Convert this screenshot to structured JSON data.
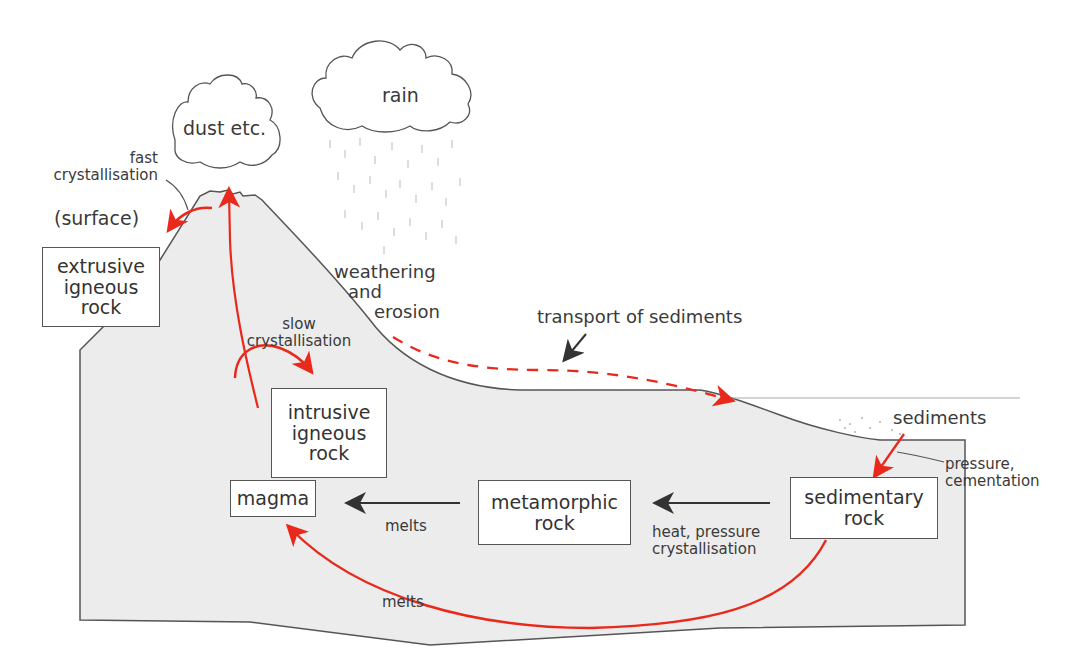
{
  "colors": {
    "ground_fill": "#ececec",
    "outline": "#555555",
    "process_arrow_red": "#e8291c",
    "process_arrow_dark": "#333333",
    "text": "#3a3a3a"
  },
  "clouds": {
    "dust": "dust etc.",
    "rain": "rain"
  },
  "rock_boxes": {
    "extrusive": [
      "extrusive",
      "igneous",
      "rock"
    ],
    "intrusive": [
      "intrusive",
      "igneous",
      "rock"
    ],
    "magma": "magma",
    "metamorphic": [
      "metamorphic",
      "rock"
    ],
    "sedimentary": [
      "sedimentary",
      "rock"
    ]
  },
  "process_labels": {
    "fast_crystallisation": [
      "fast",
      "crystallisation"
    ],
    "surface": "(surface)",
    "weathering": [
      "weathering",
      "and",
      "erosion"
    ],
    "transport": "transport of sediments",
    "slow_crystallisation": [
      "slow",
      "crystallisation"
    ],
    "sediments": "sediments",
    "pressure_cementation": [
      "pressure,",
      "cementation"
    ],
    "melts_upper": "melts",
    "heat_pressure": [
      "heat, pressure",
      "crystallisation"
    ],
    "melts_lower": "melts"
  }
}
